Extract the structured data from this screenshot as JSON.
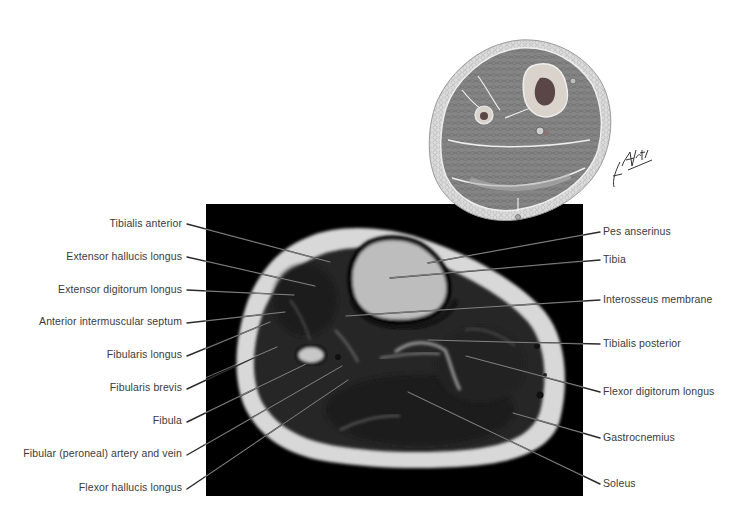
{
  "figure": {
    "type": "anatomical-cross-section",
    "illustration_signature": "F. Netter M.D.",
    "colors": {
      "background": "#ffffff",
      "mri_background": "#000000",
      "label_text": "#3a3a3a",
      "leader_line": "#2a2a2a",
      "illustration_muscle": "#7c7c7c",
      "illustration_fat": "#d6d6d6"
    }
  },
  "labels": {
    "left": [
      {
        "text": "Tibialis anterior"
      },
      {
        "text": "Extensor hallucis longus"
      },
      {
        "text": "Extensor digitorum longus"
      },
      {
        "text": "Anterior intermuscular septum"
      },
      {
        "text": "Fibularis longus"
      },
      {
        "text": "Fibularis brevis"
      },
      {
        "text": "Fibula"
      },
      {
        "text": "Fibular (peroneal) artery and vein"
      },
      {
        "text": "Flexor hallucis longus"
      }
    ],
    "right": [
      {
        "text": "Pes anserinus"
      },
      {
        "text": "Tibia"
      },
      {
        "text": "Interosseus membrane"
      },
      {
        "text": "Tibialis posterior"
      },
      {
        "text": "Flexor digitorum longus"
      },
      {
        "text": "Gastrocnemius"
      },
      {
        "text": "Soleus"
      }
    ]
  }
}
